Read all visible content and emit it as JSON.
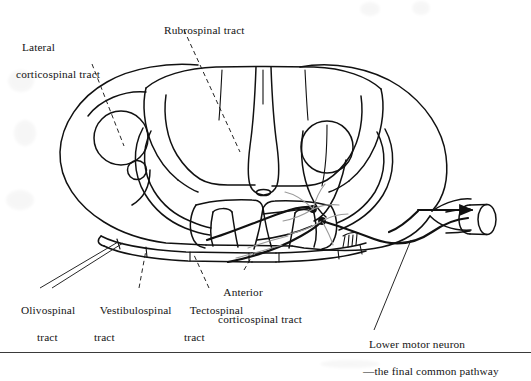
{
  "figure": {
    "ink_color": "#111111",
    "background_color": "#ffffff",
    "rule_color": "#3a3a3a",
    "nerve_root_arrow": "arrow-right"
  },
  "labels": {
    "lateral_corticospinal": {
      "line1": "Lateral",
      "line2": "corticospinal tract"
    },
    "rubrospinal": {
      "line1": "Rubrospinal tract",
      "line2": ""
    },
    "olivospinal": {
      "line1": "Olivospinal",
      "line2": "tract"
    },
    "vestibulospinal": {
      "line1": "Vestibulospinal",
      "line2": "tract"
    },
    "tectospinal": {
      "line1": "Tectospinal",
      "line2": "tract"
    },
    "anterior_corticospinal": {
      "line1": "Anterior",
      "line2": "corticospinal tract"
    },
    "lower_motor_neuron": {
      "line1": "Lower motor neuron",
      "line2": "—the final common pathway"
    }
  }
}
